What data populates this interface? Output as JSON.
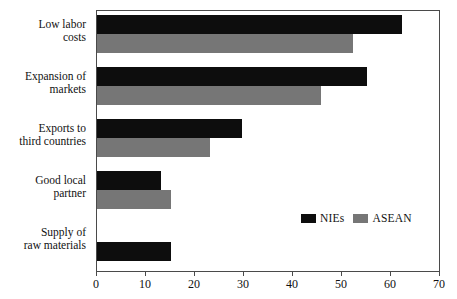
{
  "chart_data": {
    "type": "bar",
    "orientation": "horizontal",
    "title": "",
    "xlabel": "",
    "ylabel": "",
    "xlim": [
      0,
      70
    ],
    "xticks": [
      0,
      10,
      20,
      30,
      40,
      50,
      60,
      70
    ],
    "grid": false,
    "legend_position": "inside-lower-right",
    "categories": [
      "Low labor costs",
      "Expansion of markets",
      "Exports to third countries",
      "Good local partner",
      "Supply of raw materials"
    ],
    "category_lines": [
      [
        "Low labor",
        "costs"
      ],
      [
        "Expansion of",
        "markets"
      ],
      [
        "Exports to",
        "third countries"
      ],
      [
        "Good local",
        "partner"
      ],
      [
        "Supply of",
        "raw materials"
      ]
    ],
    "series": [
      {
        "name": "NIEs",
        "color": "#0d0d0d",
        "values": [
          62,
          55,
          29.5,
          13,
          15
        ]
      },
      {
        "name": "ASEAN",
        "color": "#767676",
        "values": [
          52,
          45.5,
          23,
          15,
          0
        ]
      }
    ]
  },
  "legend": {
    "items": [
      {
        "label": "NIEs",
        "color": "#0d0d0d"
      },
      {
        "label": "ASEAN",
        "color": "#767676"
      }
    ]
  },
  "axis": {
    "tick_labels": [
      "0",
      "10",
      "20",
      "30",
      "40",
      "50",
      "60",
      "70"
    ]
  },
  "colors": {
    "nies": "#0d0d0d",
    "asean": "#767676",
    "frame": "#4a4a4a",
    "background": "#ffffff",
    "text": "#111111"
  }
}
